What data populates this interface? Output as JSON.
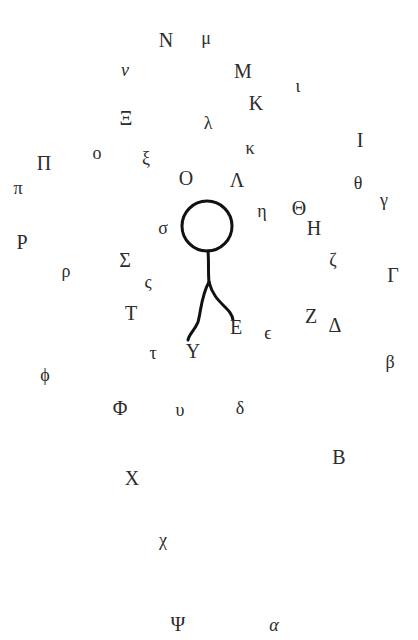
{
  "diagram": {
    "figure": {
      "circle": {
        "cx": 207,
        "cy": 226,
        "r": 25
      },
      "stroke_color": "#111111"
    },
    "glyphs": [
      {
        "char": "N",
        "name": "Nu upper",
        "x": 166,
        "y": 40,
        "case": "upper"
      },
      {
        "char": "μ",
        "name": "mu lower",
        "x": 206,
        "y": 38,
        "case": "lower"
      },
      {
        "char": "ν",
        "name": "nu lower",
        "x": 125,
        "y": 70,
        "case": "lower",
        "italic": true
      },
      {
        "char": "M",
        "name": "Mu upper",
        "x": 243,
        "y": 71,
        "case": "upper"
      },
      {
        "char": "ι",
        "name": "iota lower",
        "x": 298,
        "y": 86,
        "case": "lower"
      },
      {
        "char": "K",
        "name": "Kappa upper",
        "x": 256,
        "y": 103,
        "case": "upper"
      },
      {
        "char": "Ξ",
        "name": "Xi upper",
        "x": 126,
        "y": 118,
        "case": "upper"
      },
      {
        "char": "λ",
        "name": "lambda lower",
        "x": 208,
        "y": 123,
        "case": "lower"
      },
      {
        "char": "ο",
        "name": "omicron lower",
        "x": 97,
        "y": 153,
        "case": "lower"
      },
      {
        "char": "ξ",
        "name": "xi lower",
        "x": 146,
        "y": 158,
        "case": "lower"
      },
      {
        "char": "κ",
        "name": "kappa lower",
        "x": 250,
        "y": 148,
        "case": "lower"
      },
      {
        "char": "Ι",
        "name": "Iota upper",
        "x": 360,
        "y": 140,
        "case": "upper"
      },
      {
        "char": "Π",
        "name": "Pi upper",
        "x": 44,
        "y": 163,
        "case": "upper"
      },
      {
        "char": "π",
        "name": "pi lower",
        "x": 18,
        "y": 188,
        "case": "lower"
      },
      {
        "char": "Ο",
        "name": "Omicron upper",
        "x": 186,
        "y": 178,
        "case": "upper"
      },
      {
        "char": "Λ",
        "name": "Lambda upper",
        "x": 237,
        "y": 180,
        "case": "upper"
      },
      {
        "char": "θ",
        "name": "theta lower",
        "x": 358,
        "y": 183,
        "case": "lower"
      },
      {
        "char": "γ",
        "name": "gamma lower",
        "x": 384,
        "y": 200,
        "case": "lower"
      },
      {
        "char": "η",
        "name": "eta lower",
        "x": 262,
        "y": 211,
        "case": "lower"
      },
      {
        "char": "Θ",
        "name": "Theta upper",
        "x": 299,
        "y": 208,
        "case": "upper"
      },
      {
        "char": "Η",
        "name": "Eta upper",
        "x": 314,
        "y": 228,
        "case": "upper"
      },
      {
        "char": "σ",
        "name": "sigma lower",
        "x": 163,
        "y": 228,
        "case": "lower"
      },
      {
        "char": "Ρ",
        "name": "Rho upper",
        "x": 22,
        "y": 242,
        "case": "upper"
      },
      {
        "char": "ρ",
        "name": "rho lower",
        "x": 66,
        "y": 271,
        "case": "lower"
      },
      {
        "char": "Σ",
        "name": "Sigma upper",
        "x": 125,
        "y": 260,
        "case": "upper"
      },
      {
        "char": "ς",
        "name": "final sigma",
        "x": 148,
        "y": 282,
        "case": "lower"
      },
      {
        "char": "ζ",
        "name": "zeta lower",
        "x": 333,
        "y": 260,
        "case": "lower"
      },
      {
        "char": "Γ",
        "name": "Gamma upper",
        "x": 393,
        "y": 275,
        "case": "upper"
      },
      {
        "char": "Τ",
        "name": "Tau upper",
        "x": 131,
        "y": 313,
        "case": "upper"
      },
      {
        "char": "Ε",
        "name": "Epsilon upper",
        "x": 236,
        "y": 327,
        "case": "upper"
      },
      {
        "char": "Ζ",
        "name": "Zeta upper",
        "x": 311,
        "y": 316,
        "case": "upper"
      },
      {
        "char": "Δ",
        "name": "Delta upper",
        "x": 335,
        "y": 325,
        "case": "upper"
      },
      {
        "char": "ϵ",
        "name": "epsilon lower",
        "x": 268,
        "y": 333,
        "case": "lower"
      },
      {
        "char": "Υ",
        "name": "Upsilon upper",
        "x": 193,
        "y": 351,
        "case": "upper"
      },
      {
        "char": "τ",
        "name": "tau lower",
        "x": 153,
        "y": 353,
        "case": "lower"
      },
      {
        "char": "β",
        "name": "beta lower",
        "x": 390,
        "y": 362,
        "case": "lower"
      },
      {
        "char": "ϕ",
        "name": "phi lower",
        "x": 45,
        "y": 375,
        "case": "lower"
      },
      {
        "char": "Φ",
        "name": "Phi upper",
        "x": 120,
        "y": 408,
        "case": "upper"
      },
      {
        "char": "υ",
        "name": "upsilon lower",
        "x": 180,
        "y": 410,
        "case": "lower"
      },
      {
        "char": "δ",
        "name": "delta lower",
        "x": 240,
        "y": 408,
        "case": "lower"
      },
      {
        "char": "Β",
        "name": "Beta upper",
        "x": 339,
        "y": 457,
        "case": "upper"
      },
      {
        "char": "Χ",
        "name": "Chi upper",
        "x": 132,
        "y": 478,
        "case": "upper"
      },
      {
        "char": "χ",
        "name": "chi lower",
        "x": 163,
        "y": 540,
        "case": "lower"
      },
      {
        "char": "Ψ",
        "name": "Psi upper",
        "x": 178,
        "y": 624,
        "case": "upper"
      },
      {
        "char": "α",
        "name": "alpha lower",
        "x": 274,
        "y": 625,
        "case": "lower",
        "italic": true
      }
    ]
  }
}
